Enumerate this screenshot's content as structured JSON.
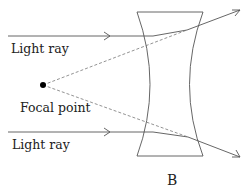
{
  "diagram": {
    "labels": {
      "top_ray": "Light ray",
      "bottom_ray": "Light ray",
      "focal_point": "Focal point",
      "caption": "B"
    },
    "colors": {
      "line": "#555555",
      "dashed": "#777777",
      "point": "#000000"
    }
  }
}
